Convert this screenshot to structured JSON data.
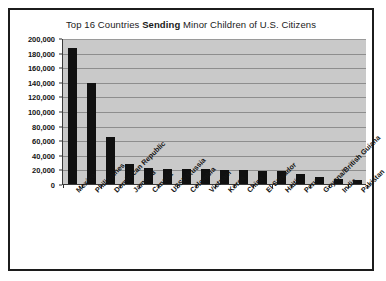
{
  "chart_data": {
    "type": "bar",
    "title": "Top 16 Countries Sending Minor Children of U.S. Citizens",
    "title_parts": {
      "before": "Top 16 Countries ",
      "emphasis": "Sending",
      "after": " Minor Children of U.S. Citizens"
    },
    "xlabel": "",
    "ylabel": "",
    "ylim": [
      0,
      200000
    ],
    "grid": true,
    "legend": "none",
    "bar_color": "#101010",
    "plot_background": "#c9c9c9",
    "gridline_color": "#8d8d8d",
    "y_ticks": [
      0,
      20000,
      40000,
      60000,
      80000,
      100000,
      120000,
      140000,
      160000,
      180000,
      200000
    ],
    "y_tick_labels": [
      "0",
      "20,000",
      "40,000",
      "60,000",
      "80,000",
      "100,000",
      "120,000",
      "140,000",
      "160,000",
      "180,000",
      "200,000"
    ],
    "categories": [
      "Mexico",
      "Philippines",
      "Dominican Republic",
      "Jamaica",
      "Canada",
      "USSR/Russia",
      "Colombia",
      "Vietnam",
      "Korea",
      "China",
      "El Salvador",
      "Haiti",
      "Peru",
      "Guyana/British Guiana",
      "India",
      "Pakistan"
    ],
    "values": [
      186000,
      139000,
      65000,
      27000,
      22000,
      21000,
      20500,
      20000,
      19500,
      19000,
      18500,
      18000,
      14000,
      9000,
      6500,
      5500
    ]
  }
}
